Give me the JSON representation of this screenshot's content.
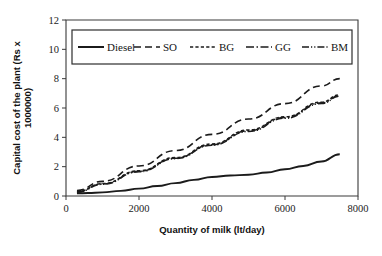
{
  "chart_data": {
    "type": "line",
    "title": "",
    "xlabel": "Quantity of milk (lt/day)",
    "ylabel": "Capital cost of the plant (Rs x 1000000)",
    "ylabel_line1": "Capital cost of the plant (Rs x",
    "ylabel_line2": "1000000)",
    "xlim": [
      0,
      8000
    ],
    "ylim": [
      0,
      12
    ],
    "xticks": [
      0,
      2000,
      4000,
      6000,
      8000
    ],
    "yticks": [
      0,
      2,
      4,
      6,
      8,
      10,
      12
    ],
    "xtick_labels": [
      "0",
      "2000",
      "4000",
      "6000",
      "8000"
    ],
    "ytick_labels": [
      "0",
      "2",
      "4",
      "6",
      "8",
      "10",
      "12"
    ],
    "grid": false,
    "legend_position": "top-inside",
    "series": [
      {
        "name": "Diesel",
        "style": "solid",
        "dash": "",
        "width": 1.9,
        "x": [
          300,
          600,
          1000,
          1500,
          2000,
          2500,
          3000,
          3500,
          4000,
          4500,
          5000,
          5500,
          6000,
          6500,
          7000,
          7500
        ],
        "values": [
          0.18,
          0.2,
          0.25,
          0.35,
          0.5,
          0.68,
          0.88,
          1.1,
          1.3,
          1.4,
          1.45,
          1.6,
          1.82,
          2.05,
          2.35,
          2.85
        ]
      },
      {
        "name": "SO",
        "style": "long-dash",
        "dash": "7,4",
        "width": 1.6,
        "x": [
          300,
          1000,
          2000,
          3000,
          4000,
          5000,
          6000,
          7000,
          7500
        ],
        "values": [
          0.38,
          1.0,
          2.05,
          3.1,
          4.2,
          5.25,
          6.3,
          7.5,
          8.0
        ]
      },
      {
        "name": "BG",
        "style": "short-dash",
        "dash": "3.2,2.2",
        "width": 1.5,
        "x": [
          300,
          1000,
          2000,
          3000,
          4000,
          5000,
          6000,
          7000,
          7500
        ],
        "values": [
          0.3,
          0.85,
          1.72,
          2.62,
          3.55,
          4.5,
          5.4,
          6.4,
          6.9
        ]
      },
      {
        "name": "GG",
        "style": "dash-dot",
        "dash": "8,2.5,1.5,2.5",
        "width": 1.5,
        "x": [
          300,
          1000,
          2000,
          3000,
          4000,
          5000,
          6000,
          7000,
          7500
        ],
        "values": [
          0.28,
          0.82,
          1.68,
          2.58,
          3.5,
          4.45,
          5.35,
          6.35,
          6.85
        ]
      },
      {
        "name": "BM",
        "style": "dash-dot-dot",
        "dash": "7,2,1.2,2,1.2,2",
        "width": 1.5,
        "x": [
          300,
          1000,
          2000,
          3000,
          4000,
          5000,
          6000,
          7000,
          7500
        ],
        "values": [
          0.26,
          0.8,
          1.65,
          2.55,
          3.46,
          4.4,
          5.3,
          6.3,
          6.8
        ]
      }
    ]
  },
  "legend": {
    "items": [
      {
        "label": "Diesel",
        "dash": ""
      },
      {
        "label": "SO",
        "dash": "7,4"
      },
      {
        "label": "BG",
        "dash": "3.2,2.2"
      },
      {
        "label": "GG",
        "dash": "8,2.5,1.5,2.5"
      },
      {
        "label": "BM",
        "dash": "7,2,1.2,2,1.2,2"
      }
    ]
  },
  "colors": {
    "series": "#1b1b1b",
    "axis": "#3a3a3a",
    "text": "#111111",
    "background": "#ffffff"
  }
}
